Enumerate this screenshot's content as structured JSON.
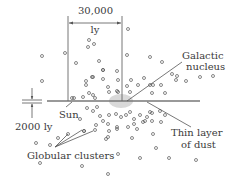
{
  "labels": {
    "width_value": "30,000",
    "width_unit": "ly",
    "galactic_nucleus_line1": "Galactic",
    "galactic_nucleus_line2": "nucleus",
    "thickness": "2000 ly",
    "sun": "Sun",
    "dust_line1": "Thin layer",
    "dust_line2": "of dust",
    "globular_clusters": "Globular clusters"
  },
  "colors": {
    "ink": "#555555",
    "text": "#3a3a3a",
    "nucleus": "#d9d9d9",
    "disk": "#777777"
  },
  "disk": {
    "x1": 47,
    "x2": 200,
    "y": 101
  },
  "nucleus": {
    "cx": 121,
    "cy": 101,
    "rx": 12,
    "ry": 7
  },
  "dimension": {
    "left_x": 68,
    "right_x": 122,
    "top_y": 16,
    "bottom_y": 101,
    "arrow_y": 23
  },
  "clusters": [
    [
      128,
      29
    ],
    [
      89,
      40
    ],
    [
      94,
      44
    ],
    [
      88,
      47
    ],
    [
      42,
      56
    ],
    [
      65,
      53
    ],
    [
      127,
      55
    ],
    [
      150,
      57
    ],
    [
      162,
      62
    ],
    [
      99,
      61
    ],
    [
      103,
      70
    ],
    [
      117,
      71
    ],
    [
      76,
      63
    ],
    [
      42,
      81
    ],
    [
      103,
      70
    ],
    [
      93,
      77
    ],
    [
      86,
      81
    ],
    [
      92,
      77
    ],
    [
      103,
      79
    ],
    [
      131,
      80
    ],
    [
      138,
      85
    ],
    [
      150,
      85
    ],
    [
      144,
      78
    ],
    [
      153,
      85
    ],
    [
      176,
      80
    ],
    [
      186,
      81
    ],
    [
      177,
      76
    ],
    [
      200,
      77
    ],
    [
      213,
      76
    ],
    [
      172,
      74
    ],
    [
      118,
      80
    ],
    [
      127,
      86
    ],
    [
      108,
      87
    ],
    [
      118,
      92
    ],
    [
      86,
      85
    ],
    [
      93,
      95
    ],
    [
      74,
      98
    ],
    [
      83,
      97
    ],
    [
      89,
      93
    ],
    [
      95,
      98
    ],
    [
      109,
      92
    ],
    [
      117,
      91
    ],
    [
      152,
      93
    ],
    [
      165,
      93
    ],
    [
      161,
      85
    ],
    [
      130,
      92
    ],
    [
      87,
      108
    ],
    [
      93,
      111
    ],
    [
      97,
      107
    ],
    [
      80,
      119
    ],
    [
      100,
      116
    ],
    [
      109,
      115
    ],
    [
      116,
      114
    ],
    [
      121,
      117
    ],
    [
      126,
      115
    ],
    [
      130,
      112
    ],
    [
      134,
      119
    ],
    [
      140,
      115
    ],
    [
      147,
      117
    ],
    [
      152,
      113
    ],
    [
      160,
      111
    ],
    [
      165,
      115
    ],
    [
      150,
      112
    ],
    [
      145,
      121
    ],
    [
      134,
      124
    ],
    [
      128,
      127
    ],
    [
      117,
      127
    ],
    [
      108,
      124
    ],
    [
      103,
      121
    ],
    [
      96,
      125
    ],
    [
      117,
      129
    ],
    [
      137,
      129
    ],
    [
      152,
      121
    ],
    [
      161,
      122
    ],
    [
      143,
      122
    ],
    [
      84,
      131
    ],
    [
      95,
      130
    ],
    [
      109,
      131
    ],
    [
      108,
      137
    ],
    [
      106,
      139
    ],
    [
      132,
      138
    ],
    [
      153,
      134
    ],
    [
      156,
      148
    ],
    [
      36,
      143
    ],
    [
      50,
      145
    ],
    [
      58,
      138
    ],
    [
      68,
      134
    ],
    [
      84,
      131
    ],
    [
      118,
      154
    ],
    [
      140,
      158
    ],
    [
      169,
      158
    ],
    [
      196,
      160
    ],
    [
      40,
      163
    ],
    [
      82,
      166
    ],
    [
      108,
      174
    ]
  ],
  "pointer_lines": {
    "galactic_nucleus": {
      "x1": 127,
      "y1": 101,
      "x2": 182,
      "y2": 62
    },
    "dust": {
      "x1": 147,
      "y1": 102,
      "x2": 191,
      "y2": 127
    },
    "sun": {
      "x1": 72,
      "y1": 101,
      "x2": 66,
      "y2": 107
    },
    "globular": [
      {
        "x1": 55,
        "y1": 147,
        "x2": 68,
        "y2": 134
      },
      {
        "x1": 55,
        "y1": 147,
        "x2": 82,
        "y2": 130
      },
      {
        "x1": 55,
        "y1": 147,
        "x2": 93,
        "y2": 131
      }
    ]
  }
}
